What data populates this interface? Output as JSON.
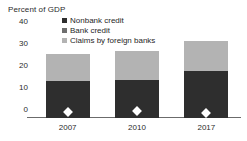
{
  "chart_data": {
    "type": "bar",
    "stacked": true,
    "title": "",
    "ylabel": "Percent of GDP",
    "xlabel": "",
    "categories": [
      "2007",
      "2010",
      "2017"
    ],
    "ylim": [
      0,
      40
    ],
    "yticks": [
      0,
      10,
      20,
      30,
      40
    ],
    "ytick_labels": [
      "0",
      "10",
      "20",
      "30",
      "40"
    ],
    "grid": false,
    "legend_position": "top-center",
    "series": [
      {
        "name": "Nonbank credit",
        "color": "#2e2e2e",
        "values": [
          17.0,
          17.5,
          21.5
        ]
      },
      {
        "name": "Bank credit",
        "color": "#6e6e6e",
        "values": [
          0,
          0,
          0
        ]
      },
      {
        "name": "Claims by foreign banks",
        "color": "#b3b3b3",
        "values": [
          12.0,
          13.0,
          13.5
        ]
      }
    ],
    "totals": [
      29.0,
      30.5,
      35.0
    ],
    "markers": {
      "name": "marker-diamond",
      "color": "#ffffff",
      "values": [
        2.6,
        3.0,
        2.4
      ]
    }
  },
  "axis": {
    "y_title": "Percent of GDP"
  },
  "legend": {
    "items": [
      {
        "label": "Nonbank credit",
        "color": "#2e2e2e"
      },
      {
        "label": "Bank credit",
        "color": "#6e6e6e"
      },
      {
        "label": "Claims by foreign banks",
        "color": "#b3b3b3"
      }
    ]
  }
}
